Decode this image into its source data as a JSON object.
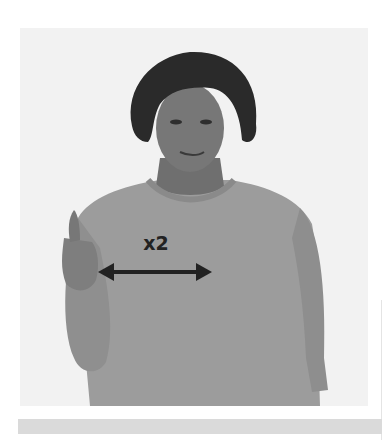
{
  "illustration": {
    "subject": "person-signing",
    "gesture": "thumbs-up hand moving side to side",
    "motion_label": "x2",
    "motion_arrow": "double-headed-horizontal-arrow",
    "colors": {
      "background": "#f2f2f2",
      "sweater": "#9a9a9a",
      "skin": "#7a7a7a",
      "hair": "#2a2a2a",
      "arrow": "#222222"
    }
  },
  "caption_bar": {
    "color": "#dadada"
  }
}
